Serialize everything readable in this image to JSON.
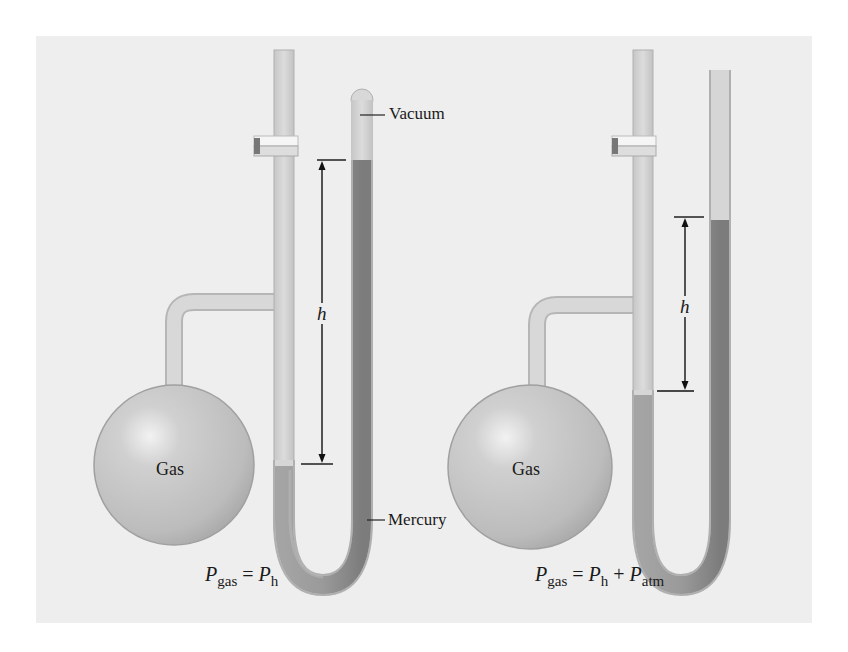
{
  "figure": {
    "background_color": "#eeeeee",
    "page_color": "#ffffff",
    "glass_color": "#d4d4d4",
    "mercury_color": "#9a9a9a",
    "bulb_color": "#c8c8c8",
    "left_manometer": {
      "type": "closed-end manometer",
      "labels": {
        "vacuum": "Vacuum",
        "mercury": "Mercury",
        "gas": "Gas",
        "height": "h"
      },
      "equation": {
        "lhs": "P",
        "lhs_sub": "gas",
        "eq": "=",
        "rhs1": "P",
        "rhs1_sub": "h"
      }
    },
    "right_manometer": {
      "type": "open-end manometer",
      "labels": {
        "gas": "Gas",
        "height": "h"
      },
      "equation": {
        "lhs": "P",
        "lhs_sub": "gas",
        "eq": "=",
        "rhs1": "P",
        "rhs1_sub": "h",
        "plus": "+",
        "rhs2": "P",
        "rhs2_sub": "atm"
      }
    }
  }
}
